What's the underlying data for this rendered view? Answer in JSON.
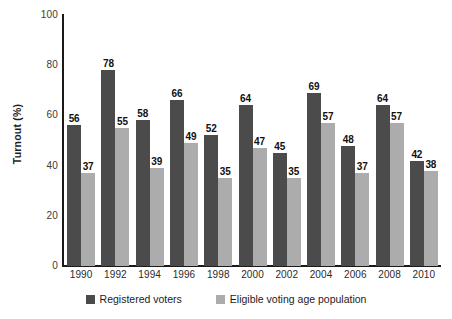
{
  "chart_data": {
    "type": "bar",
    "title": "",
    "subtitle": "",
    "xlabel": "",
    "ylabel": "Turnout (%)",
    "ylim": [
      0,
      100
    ],
    "yticks": [
      0,
      20,
      40,
      60,
      80,
      100
    ],
    "ytick_labels": [
      "0",
      "20",
      "40",
      "60",
      "80",
      "100"
    ],
    "grid": false,
    "legend_position": "bottom",
    "categories": [
      "1990",
      "1992",
      "1994",
      "1996",
      "1998",
      "2000",
      "2002",
      "2004",
      "2006",
      "2008",
      "2010"
    ],
    "series": [
      {
        "name": "Registered voters",
        "color": "#4b4b4b",
        "values": [
          56,
          78,
          58,
          66,
          52,
          64,
          45,
          69,
          48,
          64,
          42
        ]
      },
      {
        "name": "Eligible voting age population",
        "color": "#acacac",
        "values": [
          37,
          55,
          39,
          49,
          35,
          47,
          35,
          57,
          37,
          57,
          38
        ]
      }
    ]
  },
  "axes": {
    "y_title": "Turnout (%)",
    "y_tick_labels": [
      "100",
      "80",
      "60",
      "40",
      "20",
      "0"
    ],
    "x_tick_labels": [
      "1990",
      "1992",
      "1994",
      "1996",
      "1998",
      "2000",
      "2002",
      "2004",
      "2006",
      "2008",
      "2010"
    ]
  },
  "legend": {
    "items": [
      {
        "label": "Registered voters",
        "swatch": "dark-gray-swatch"
      },
      {
        "label": "Eligible voting age population",
        "swatch": "light-gray-swatch"
      }
    ]
  },
  "labels": {
    "registered": [
      "56",
      "78",
      "58",
      "66",
      "52",
      "64",
      "45",
      "69",
      "48",
      "64",
      "42"
    ],
    "eligible": [
      "37",
      "55",
      "39",
      "49",
      "35",
      "47",
      "35",
      "57",
      "37",
      "57",
      "38"
    ]
  }
}
